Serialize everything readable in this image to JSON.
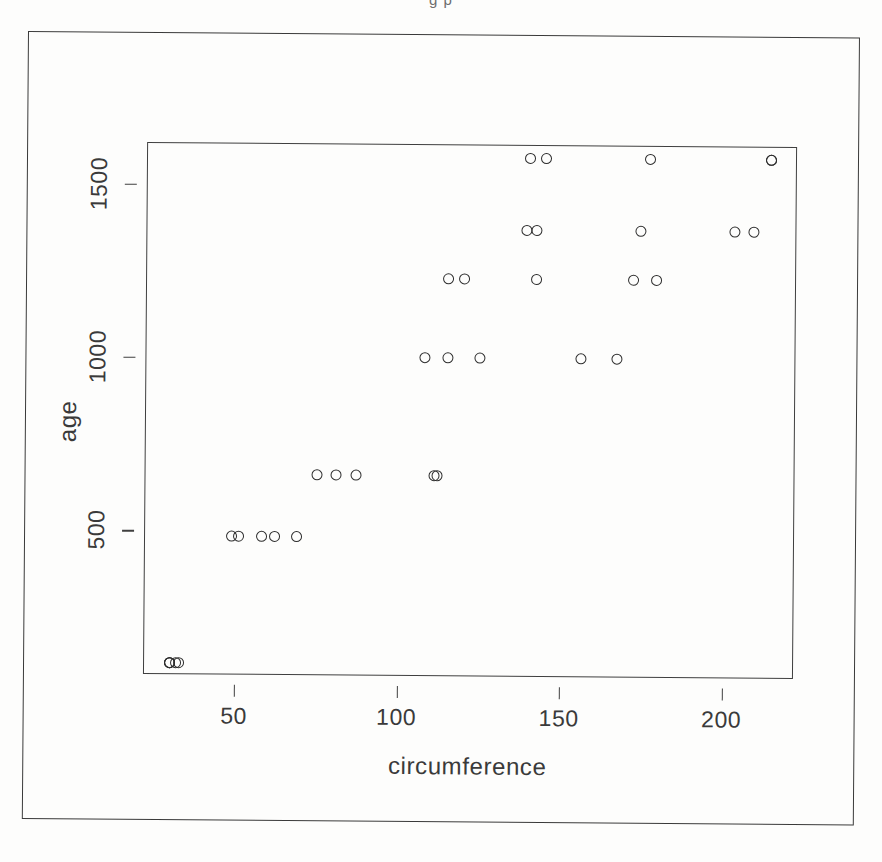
{
  "figure": {
    "top_cut_text": "g p",
    "x_axis_title": "circumference",
    "y_axis_title": "age"
  },
  "chart_data": {
    "type": "scatter",
    "title": "",
    "subtitle": "",
    "xlabel": "circumference",
    "ylabel": "age",
    "xlim": [
      22,
      222
    ],
    "ylim": [
      85,
      1620
    ],
    "xticks": [
      50,
      100,
      150,
      200
    ],
    "yticks": [
      500,
      1000,
      1500
    ],
    "grid": false,
    "legend": null,
    "marker": "open-circle",
    "marker_color": "#2d2d2d",
    "n_points": 35,
    "x": [
      30,
      33,
      30,
      32,
      30,
      58,
      69,
      51,
      62,
      49,
      87,
      111,
      75,
      112,
      81,
      115,
      156,
      108,
      167,
      125,
      120,
      172,
      115,
      179,
      142,
      142,
      203,
      139,
      209,
      174,
      145,
      214,
      140,
      214,
      177
    ],
    "y": [
      118,
      118,
      118,
      118,
      118,
      484,
      484,
      484,
      484,
      484,
      664,
      664,
      664,
      664,
      664,
      1004,
      1004,
      1004,
      1004,
      1004,
      1231,
      1231,
      1231,
      1231,
      1231,
      1372,
      1372,
      1372,
      1372,
      1372,
      1582,
      1582,
      1582,
      1582,
      1582
    ],
    "xlabel_unit": "mm",
    "ylabel_unit": "days",
    "age_levels": [
      118,
      484,
      664,
      1004,
      1231,
      1372,
      1582
    ],
    "series": [
      {
        "name": "all points",
        "points": [
          [
            30,
            118
          ],
          [
            33,
            118
          ],
          [
            30,
            118
          ],
          [
            32,
            118
          ],
          [
            30,
            118
          ],
          [
            58,
            484
          ],
          [
            69,
            484
          ],
          [
            51,
            484
          ],
          [
            62,
            484
          ],
          [
            49,
            484
          ],
          [
            87,
            664
          ],
          [
            111,
            664
          ],
          [
            75,
            664
          ],
          [
            112,
            664
          ],
          [
            81,
            664
          ],
          [
            115,
            1004
          ],
          [
            156,
            1004
          ],
          [
            108,
            1004
          ],
          [
            167,
            1004
          ],
          [
            125,
            1004
          ],
          [
            120,
            1231
          ],
          [
            172,
            1231
          ],
          [
            115,
            1231
          ],
          [
            179,
            1231
          ],
          [
            142,
            1231
          ],
          [
            142,
            1372
          ],
          [
            203,
            1372
          ],
          [
            139,
            1372
          ],
          [
            209,
            1372
          ],
          [
            174,
            1372
          ],
          [
            145,
            1582
          ],
          [
            214,
            1582
          ],
          [
            140,
            1582
          ],
          [
            214,
            1582
          ],
          [
            177,
            1582
          ]
        ]
      }
    ]
  }
}
